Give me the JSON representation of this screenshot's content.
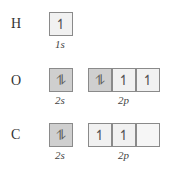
{
  "rows": [
    {
      "element": "H",
      "groups": [
        {
          "label": "1s",
          "boxes": [
            {
              "fill": "half",
              "glyph": "↿"
            }
          ]
        }
      ]
    },
    {
      "element": "O",
      "groups": [
        {
          "label": "2s",
          "boxes": [
            {
              "fill": "full",
              "glyph": "⥮"
            }
          ]
        },
        {
          "label": "2p",
          "boxes": [
            {
              "fill": "full",
              "glyph": "⥮"
            },
            {
              "fill": "half",
              "glyph": "↿"
            },
            {
              "fill": "half",
              "glyph": "↿"
            }
          ]
        }
      ]
    },
    {
      "element": "C",
      "groups": [
        {
          "label": "2s",
          "boxes": [
            {
              "fill": "full",
              "glyph": "⥮"
            }
          ]
        },
        {
          "label": "2p",
          "boxes": [
            {
              "fill": "half",
              "glyph": "↿"
            },
            {
              "fill": "half",
              "glyph": "↿"
            },
            {
              "fill": "empty",
              "glyph": ""
            }
          ]
        }
      ]
    }
  ]
}
